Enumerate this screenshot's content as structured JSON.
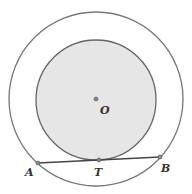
{
  "diagram": {
    "type": "concentric-circles",
    "center": {
      "label": "O",
      "x": 96,
      "y": 99
    },
    "outer_circle": {
      "r": 87,
      "stroke": "#777777"
    },
    "inner_circle": {
      "r": 60,
      "fill": "#e6e6e6",
      "stroke": "#666666"
    },
    "chord": {
      "from": "A",
      "to": "B",
      "tangent_point": "T",
      "stroke": "#444444"
    },
    "points": [
      {
        "label": "A",
        "x": 38,
        "y": 163,
        "lx": 25,
        "ly": 176
      },
      {
        "label": "T",
        "x": 99,
        "y": 160,
        "lx": 94,
        "ly": 176
      },
      {
        "label": "B",
        "x": 160,
        "y": 157,
        "lx": 161,
        "ly": 172
      }
    ],
    "center_label": {
      "text": "O",
      "lx": 100,
      "ly": 114
    }
  }
}
